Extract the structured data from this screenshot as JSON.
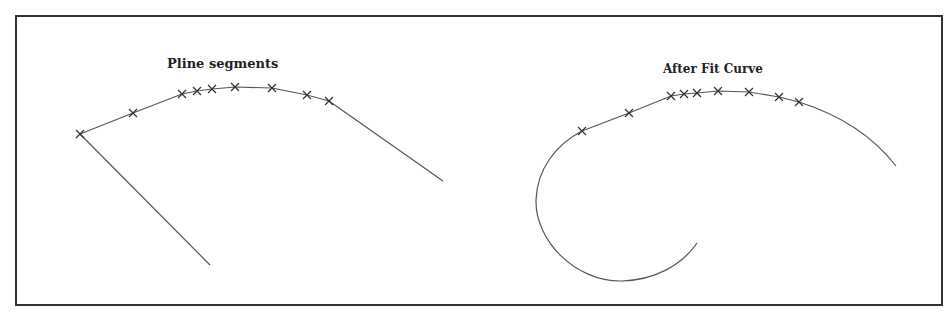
{
  "diagram": {
    "left_panel": {
      "title": "Pline segments",
      "vertices": [
        [
          80,
          134
        ],
        [
          133,
          113
        ],
        [
          182,
          94
        ],
        [
          197,
          91
        ],
        [
          212,
          89
        ],
        [
          235,
          87
        ],
        [
          272,
          88
        ],
        [
          307,
          95
        ],
        [
          329,
          101
        ]
      ],
      "start_segment": [
        [
          80,
          134
        ],
        [
          210,
          265
        ]
      ],
      "end_segment": [
        [
          329,
          101
        ],
        [
          443,
          181
        ]
      ]
    },
    "right_panel": {
      "title": "After Fit Curve",
      "vertices": [
        [
          582,
          131
        ],
        [
          629,
          113
        ],
        [
          671,
          96
        ],
        [
          684,
          94
        ],
        [
          697,
          93
        ],
        [
          718,
          91
        ],
        [
          749,
          92
        ],
        [
          779,
          97
        ],
        [
          799,
          102
        ]
      ]
    },
    "colors": {
      "line": "#555555",
      "marker": "#333333",
      "frame": "#333333"
    }
  }
}
